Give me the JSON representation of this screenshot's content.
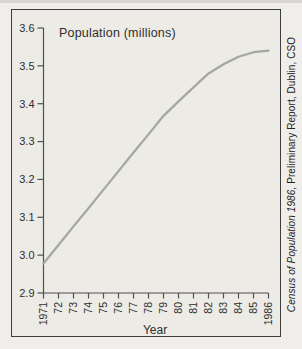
{
  "chart": {
    "title": "Population (millions)",
    "xlabel": "Year",
    "source_italic": "Census of Population 1986,",
    "source_rest": " Preliminary Report, Dublin, CSO"
  },
  "colors": {
    "curve": "#a6a6a3",
    "axis": "#4f4f4f",
    "text": "#2e2e2e",
    "page_background": "#f0eeea",
    "chart_background": "#edebe6",
    "border": "#3e3e3e"
  },
  "chart_data": {
    "type": "line",
    "title": "Population (millions)",
    "xlabel": "Year",
    "ylabel": "Population (millions)",
    "source": "Census of Population 1986, Preliminary Report, Dublin, CSO",
    "x": [
      1971,
      1972,
      1973,
      1974,
      1975,
      1976,
      1977,
      1978,
      1979,
      1980,
      1981,
      1982,
      1983,
      1984,
      1985,
      1986
    ],
    "x_tick_labels": [
      "1971",
      "72",
      "73",
      "74",
      "75",
      "76",
      "77",
      "78",
      "79",
      "80",
      "81",
      "82",
      "83",
      "84",
      "85",
      "1986"
    ],
    "values": [
      2.978,
      3.027,
      3.076,
      3.124,
      3.173,
      3.222,
      3.271,
      3.319,
      3.368,
      3.406,
      3.443,
      3.48,
      3.504,
      3.524,
      3.536,
      3.54
    ],
    "y_ticks": [
      2.9,
      3.0,
      3.1,
      3.2,
      3.3,
      3.4,
      3.5,
      3.6
    ],
    "ylim": [
      2.9,
      3.6
    ],
    "grid": false,
    "legend": false
  }
}
